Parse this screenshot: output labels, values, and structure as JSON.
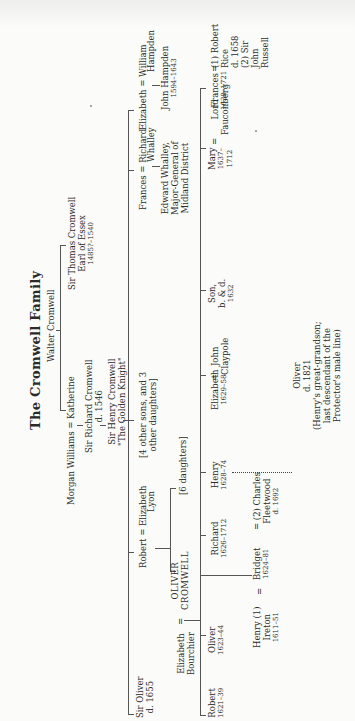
{
  "title": "The Cromwell Family",
  "orientation": "rotated 90° counter-clockwise",
  "tree": {
    "walter": "Walter Cromwell",
    "katherine_line": "Morgan Williams = Katherine",
    "richard": {
      "name": "Sir Richard Cromwell",
      "dates": "d. 1546"
    },
    "henry": {
      "name": "Sir Henry Cromwell",
      "epithet": "\"The Golden Knight\""
    },
    "thomas": {
      "name": "Sir Thomas Cromwell",
      "title": "Earl of Essex",
      "dates": "1485?–1540"
    },
    "henry_children": {
      "sir_oliver": {
        "name": "Sir Oliver",
        "dates": "d. 1655"
      },
      "robert": {
        "name": "Robert",
        "spouse": "Elizabeth",
        "spouse2": "Lyon"
      },
      "others": {
        "line1": "[4 other sons, and 3",
        "line2": "other daughters]"
      },
      "frances": {
        "name": "Frances",
        "spouse": "Richard",
        "spouse2": "Whalley"
      },
      "elizabeth": {
        "name": "Elizabeth",
        "spouse": "William",
        "spouse2": "Hampden"
      }
    },
    "edward_whalley": {
      "line1": "Edward Whalley,",
      "line2": "Major-General of",
      "line3": "Midland District"
    },
    "john_hampden": {
      "name": "John Hampden",
      "dates": "1594–1643"
    },
    "robert_children": {
      "oliver": {
        "line1": "OLIVER",
        "line2": "CROMWELL"
      },
      "oliver_spouse": {
        "line1": "Elizabeth",
        "line2": "Bourchier"
      },
      "daughters": "[6 daughters]"
    },
    "oliver_children": [
      {
        "name": "Robert",
        "dates": "1621–39"
      },
      {
        "name": "Oliver",
        "dates": "1623–44"
      },
      {
        "name": "Bridget",
        "dates": "1624–81"
      },
      {
        "name": "Richard",
        "dates": "1626–1712"
      },
      {
        "name": "Henry",
        "dates": "1628–74"
      },
      {
        "name": "Elizabeth",
        "dates": "1629–58",
        "spouse": "John",
        "spouse2": "Claypole"
      },
      {
        "name": "Son,",
        "dates": "b. & d.",
        "dates2": "1632"
      },
      {
        "name": "Mary",
        "dates": "1637–",
        "dates2": "1712",
        "spouse": "Lord",
        "spouse2": "Fauconberg"
      },
      {
        "name": "Frances",
        "dates": "1638–1721",
        "spouse": "(1) Robert",
        "spouse2": "Rice",
        "spouse3": "d. 1658",
        "spouse4": "(2) Sir",
        "spouse5": "John",
        "spouse6": "Russell"
      }
    ],
    "ireton": {
      "line1": "Henry (1)",
      "line2": "Ireton",
      "line3": "1611–51"
    },
    "fleetwood": {
      "line1": "= (2) Charles",
      "line2": "Fleetwood",
      "line3": "d. 1692"
    },
    "last_oliver": {
      "line1": "Oliver",
      "line2": "d. 1821",
      "note1": "(Henry's great-grandson;",
      "note2": "last descendant of the",
      "note3": "Protector's male line)"
    },
    "equals": "="
  }
}
